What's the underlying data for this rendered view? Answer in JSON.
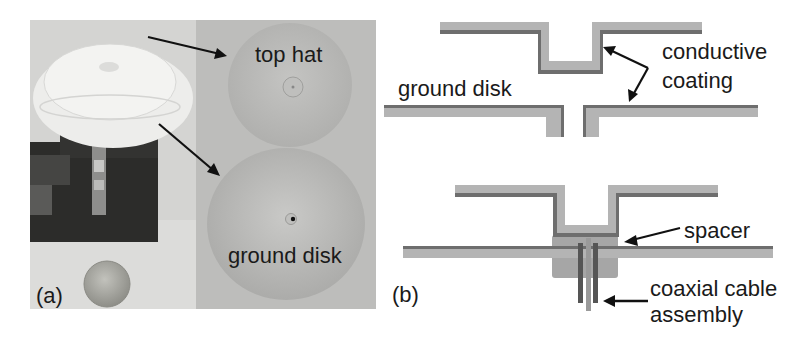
{
  "figure": {
    "panel_a": {
      "label": "(a)",
      "annotations": {
        "top_hat": "top hat",
        "ground_disk": "ground disk"
      },
      "description": "Photograph of 3D-printed antenna assembly: top hat and ground disk mounted on connector block, with a coin for scale"
    },
    "panel_b": {
      "label": "(b)",
      "upper_diagram": {
        "ground_disk_label": "ground disk",
        "coating_label_line1": "conductive",
        "coating_label_line2": "coating"
      },
      "lower_diagram": {
        "spacer_label": "spacer",
        "coax_label_line1": "coaxial cable",
        "coax_label_line2": "assembly"
      }
    },
    "colors": {
      "substrate": "#b4b4b4",
      "coating": "#6e6e6e",
      "spacer": "#a2a2a2",
      "photo_left_bg": "#d2d2d0",
      "photo_right_bg": "#b9b9b7",
      "text": "#1a1a1a"
    }
  }
}
